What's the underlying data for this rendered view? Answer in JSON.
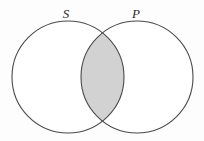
{
  "figure": {
    "type": "venn-diagram",
    "title": "",
    "background_color": "#fdfdfd",
    "stroke_color": "#4a4a4a",
    "stroke_width": 1.1,
    "shade_color": "#d2d2d2",
    "label_color": "#2b2b2b",
    "canvas": {
      "width": 204,
      "height": 141
    }
  },
  "sets": [
    {
      "id": "S",
      "label": "S",
      "label_x": 66,
      "label_y": 18,
      "circle": {
        "cx": 68,
        "cy": 77,
        "r": 56
      },
      "fill": "#ffffff"
    },
    {
      "id": "P",
      "label": "P",
      "label_x": 136,
      "label_y": 18,
      "circle": {
        "cx": 137,
        "cy": 77,
        "r": 56
      },
      "fill": "#ffffff"
    }
  ],
  "regions": [
    {
      "id": "S-only",
      "name": "S not P",
      "shaded": false,
      "fill": "#ffffff"
    },
    {
      "id": "S-and-P",
      "name": "S intersect P",
      "shaded": true,
      "fill": "#d2d2d2"
    },
    {
      "id": "P-only",
      "name": "P not S",
      "shaded": false,
      "fill": "#ffffff"
    }
  ]
}
